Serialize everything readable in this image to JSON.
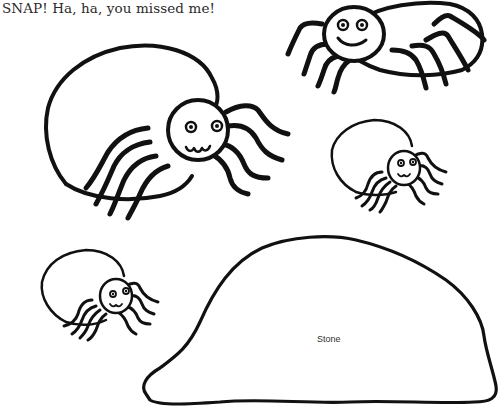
{
  "caption": {
    "text": "SNAP! Ha, ha, you missed me!"
  },
  "illustration": {
    "spiders": [
      {
        "id": "large-spider",
        "position": "top-left",
        "face": "smiling"
      },
      {
        "id": "top-right-spider",
        "position": "top-right",
        "face": "smiling"
      },
      {
        "id": "small-spider-right",
        "position": "middle-right",
        "face": "smiling"
      },
      {
        "id": "small-spider-left",
        "position": "bottom-left",
        "face": "smiling"
      }
    ],
    "stone": {
      "label": "Stone"
    }
  },
  "colors": {
    "line": "#111111",
    "background": "#ffffff",
    "text": "#2a2a2a"
  }
}
